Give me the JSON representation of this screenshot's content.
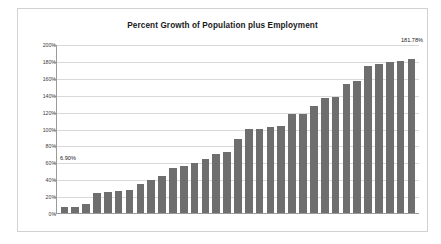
{
  "chart_data": {
    "type": "bar",
    "title": "Percent Growth of Population plus Employment",
    "xlabel": "",
    "ylabel": "",
    "ylim": [
      0,
      200
    ],
    "yunit": "%",
    "grid": true,
    "legend": "none",
    "ytick_labels": [
      "200%",
      "180%",
      "160%",
      "140%",
      "120%",
      "100%",
      "80%",
      "60%",
      "40%",
      "20%",
      "0%"
    ],
    "ytick_values": [
      200,
      180,
      160,
      140,
      120,
      100,
      80,
      60,
      40,
      20,
      0
    ],
    "categories": [
      "1",
      "2",
      "3",
      "4",
      "5",
      "6",
      "7",
      "8",
      "9",
      "10",
      "11",
      "12",
      "13",
      "14",
      "15",
      "16",
      "17",
      "18",
      "19",
      "20",
      "21",
      "22",
      "23",
      "24",
      "25",
      "26",
      "27",
      "28",
      "29",
      "30",
      "31",
      "32",
      "33"
    ],
    "values": [
      6.9,
      7.1,
      10.3,
      24.2,
      25.3,
      25.8,
      27.1,
      34.8,
      39.6,
      43.8,
      52.7,
      55.8,
      58.9,
      63.6,
      70.1,
      71.8,
      87.6,
      99.2,
      99.3,
      101.6,
      102.6,
      116.9,
      117.6,
      126.3,
      136.4,
      137.6,
      152.8,
      155.8,
      174.4,
      176.6,
      178.9,
      180.4,
      181.78
    ],
    "annotations": [
      {
        "name": "first-value-label",
        "text": "6.90%",
        "series_index": 0
      },
      {
        "name": "last-value-label",
        "text": "181.78%",
        "series_index": 32
      }
    ],
    "colors": {
      "bar": "#6e6e6e",
      "gridline": "#d9d9d9",
      "axis": "#9a9a9a",
      "frame_border": "#d2d2d2",
      "text": "#1a1a1a",
      "background": "#ffffff"
    }
  }
}
